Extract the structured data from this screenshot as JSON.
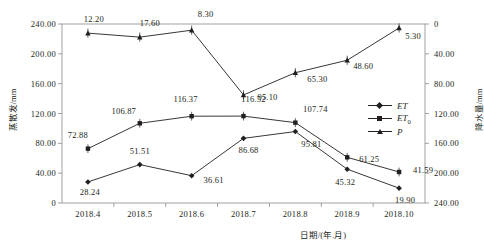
{
  "chart_data": {
    "type": "line",
    "title": "",
    "xlabel": "日期/(年.月)",
    "ylabel": "蒸散发/mm",
    "ylabel_secondary": "降水量/mm",
    "categories": [
      "2018.4",
      "2018.5",
      "2018.6",
      "2018.7",
      "2018.8",
      "2018.9",
      "2018.10"
    ],
    "ylim": [
      0,
      240
    ],
    "yticks": [
      "0",
      "40.00",
      "80.00",
      "120.00",
      "160.00",
      "200.00",
      "240.00"
    ],
    "ylim_secondary": [
      0,
      240
    ],
    "yticks_secondary": [
      "0",
      "40.00",
      "80.00",
      "120.00",
      "160.00",
      "200.00",
      "240.00"
    ],
    "secondary_axis_inverted": true,
    "grid": false,
    "legend_position": "center-right",
    "series": [
      {
        "name": "ET",
        "axis": "left",
        "marker": "diamond",
        "color": "#231f20",
        "values": [
          28.24,
          51.51,
          36.61,
          86.68,
          95.81,
          45.32,
          19.9
        ],
        "labels": [
          "28.24",
          "51.51",
          "36.61",
          "86.68",
          "95.81",
          "45.32",
          "19.90"
        ]
      },
      {
        "name": "ET₀",
        "axis": "left",
        "marker": "square",
        "color": "#231f20",
        "values": [
          72.88,
          106.87,
          116.37,
          116.52,
          107.74,
          61.25,
          41.59
        ],
        "labels": [
          "72.88",
          "106.87",
          "116.37",
          "116.52",
          "107.74",
          "61.25",
          "41.59"
        ]
      },
      {
        "name": "P",
        "axis": "right",
        "marker": "triangle",
        "color": "#231f20",
        "values": [
          12.2,
          17.6,
          8.3,
          95.1,
          65.3,
          48.6,
          5.3
        ],
        "labels": [
          "12.20",
          "17.60",
          "8.30",
          "95.10",
          "65.30",
          "48.60",
          "5.30"
        ]
      }
    ]
  },
  "legend": {
    "items": [
      {
        "label": "ET",
        "sub": ""
      },
      {
        "label": "ET",
        "sub": "0"
      },
      {
        "label": "P",
        "sub": ""
      }
    ]
  }
}
